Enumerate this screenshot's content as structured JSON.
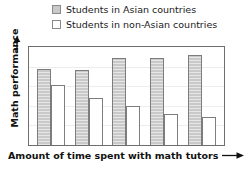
{
  "chart_data": {
    "type": "bar",
    "title": "",
    "subtitle": "",
    "xlabel": "Amount of time spent with math tutors",
    "ylabel": "Math performance",
    "categories": [
      "",
      "",
      "",
      "",
      ""
    ],
    "grid": true,
    "gridline_count": 4,
    "axis_ticks_labeled": false,
    "ylim": [
      0,
      100
    ],
    "legend_position": "top",
    "series": [
      {
        "name": "Students in Asian countries",
        "color": "#c9c9c9",
        "border_color": "#7d7d7d",
        "values": [
          78,
          77,
          89,
          89,
          92
        ]
      },
      {
        "name": "Students in non-Asian countries",
        "color": "#ffffff",
        "border_color": "#7d7d7d",
        "values": [
          61,
          48,
          40,
          32,
          29
        ]
      }
    ],
    "annotations": {
      "x_axis_arrow": "right-arrow",
      "y_axis_arrow": "up-arrow"
    }
  },
  "legend": {
    "items": [
      {
        "label": "Students in Asian countries",
        "swatch": "filled-gray-square"
      },
      {
        "label": "Students in non-Asian countries",
        "swatch": "empty-white-square"
      }
    ]
  },
  "axes": {
    "y_label": "Math performance",
    "x_label": "Amount of time spent with math tutors"
  },
  "colors": {
    "series_asian": "#c9c9c9",
    "series_non_asian": "#ffffff",
    "bar_border": "#7d7d7d",
    "plot_border": "#6e6e6e",
    "gridline": "#ededed",
    "text": "#111111",
    "background": "#ffffff"
  }
}
